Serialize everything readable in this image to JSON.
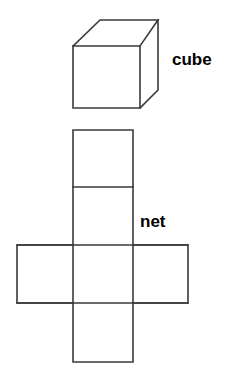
{
  "figure": {
    "background_color": "#ffffff",
    "stroke_color": "#3a3a3a",
    "text_color": "#000000",
    "width": 227,
    "height": 382
  },
  "labels": {
    "cube": "cube",
    "net": "net"
  },
  "cube": {
    "name": "cube-solid",
    "description": "3D line drawing of a cube in oblique/isometric projection",
    "front_face": {
      "left": 73,
      "top": 46,
      "right": 140,
      "bottom": 108
    },
    "depth_offset": {
      "dx": 18,
      "dy": -26
    },
    "vertices": {
      "front_top_left": [
        73,
        46
      ],
      "front_top_right": [
        140,
        46
      ],
      "front_bottom_right": [
        140,
        108
      ],
      "front_bottom_left": [
        73,
        108
      ],
      "back_top_left": [
        100,
        20
      ],
      "back_top_right": [
        158,
        20
      ],
      "back_bottom_right": [
        158,
        90
      ]
    }
  },
  "net": {
    "name": "cube-net",
    "description": "Cross-shaped net of a cube: 6 squares, a vertical column of four with one square on each side of the third",
    "square_count": 6,
    "column_left": 73,
    "column_right": 133,
    "rows": [
      130,
      187,
      245,
      303,
      362
    ],
    "side_left": 17,
    "side_right": 188,
    "squares": [
      {
        "id": "top",
        "x": 73,
        "y": 130,
        "w": 60,
        "h": 57
      },
      {
        "id": "upper-middle",
        "x": 73,
        "y": 187,
        "w": 60,
        "h": 58
      },
      {
        "id": "left",
        "x": 17,
        "y": 245,
        "w": 56,
        "h": 58
      },
      {
        "id": "center",
        "x": 73,
        "y": 245,
        "w": 60,
        "h": 58
      },
      {
        "id": "right",
        "x": 133,
        "y": 245,
        "w": 55,
        "h": 58
      },
      {
        "id": "bottom",
        "x": 73,
        "y": 303,
        "w": 60,
        "h": 59
      }
    ]
  }
}
